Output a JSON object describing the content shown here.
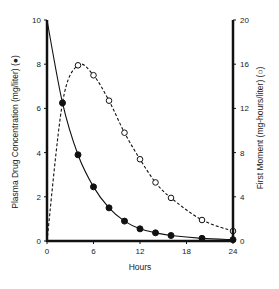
{
  "chart_data": {
    "type": "line",
    "title": "",
    "xlabel": "Hours",
    "ylabel": "Plasma Drug Concentration (mg/liter) (●)",
    "y2label": "First Moment (mg-hours/liter) (○)",
    "xlim": [
      0,
      24
    ],
    "ylim": [
      0,
      10
    ],
    "y2lim": [
      0,
      20
    ],
    "x_ticks": [
      0,
      6,
      12,
      18,
      24
    ],
    "y_ticks": [
      0,
      2,
      4,
      6,
      8,
      10
    ],
    "y2_ticks": [
      0,
      4,
      8,
      12,
      16,
      20
    ],
    "grid": false,
    "legend": "none (markers identified in axis labels)",
    "series": [
      {
        "name": "Plasma Drug Concentration",
        "axis": "left",
        "marker": "filled-circle",
        "line": "solid",
        "x": [
          0,
          2,
          4,
          6,
          8,
          10,
          12,
          14,
          16,
          20,
          24
        ],
        "values": [
          10,
          6.25,
          3.9,
          2.45,
          1.5,
          0.9,
          0.55,
          0.37,
          0.25,
          0.12,
          0.06
        ],
        "markers_at": [
          2,
          4,
          6,
          8,
          10,
          12,
          14,
          16,
          20,
          24
        ]
      },
      {
        "name": "First Moment",
        "axis": "right",
        "marker": "open-circle",
        "line": "dashed",
        "x": [
          0,
          2,
          4,
          6,
          8,
          10,
          12,
          14,
          16,
          20,
          24
        ],
        "values": [
          0,
          12.5,
          15.9,
          15.0,
          12.7,
          9.8,
          7.4,
          5.3,
          3.9,
          1.9,
          0.9
        ],
        "markers_at": [
          4,
          6,
          8,
          10,
          12,
          14,
          16,
          20,
          24
        ]
      }
    ]
  }
}
